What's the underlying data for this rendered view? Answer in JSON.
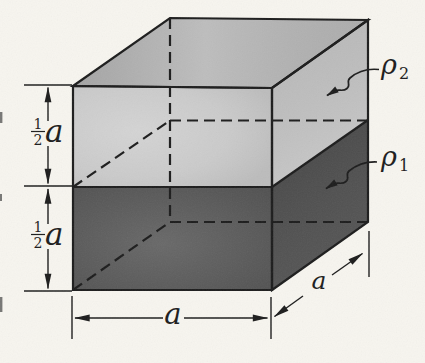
{
  "diagram": {
    "background": "#f7f5ef",
    "ink": "#1c1c1c",
    "colors": {
      "top_face": "#b6b6b6",
      "front_top_face": "#c8c8c8",
      "right_top_face": "#c2c2c2",
      "front_bottom_face": "#585858",
      "right_bottom_face": "#4a4a4a"
    },
    "labels": {
      "rho_top": {
        "base": "ρ",
        "sub": "2"
      },
      "rho_bottom": {
        "base": "ρ",
        "sub": "1"
      },
      "half_height_top": {
        "num": "1",
        "den": "2",
        "var": "a"
      },
      "half_height_bottom": {
        "num": "1",
        "den": "2",
        "var": "a"
      },
      "width": "a",
      "depth": "a"
    }
  }
}
